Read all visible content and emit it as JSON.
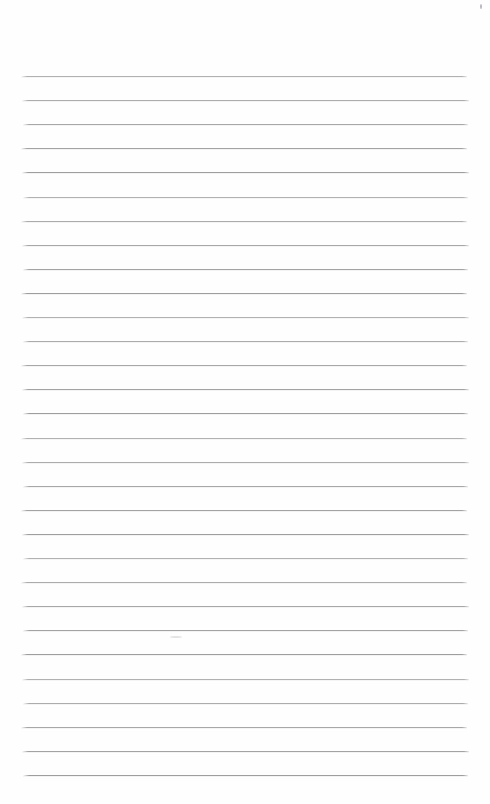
{
  "page": {
    "type": "blank-ruled-notebook-page",
    "background_color": "#fefefe",
    "width": 490,
    "height": 804,
    "text_content": ""
  },
  "ruling": {
    "line_count": 30,
    "first_line_y": 76,
    "line_spacing": 24.1,
    "left_x": 21,
    "right_x": 468,
    "line_color": "#949494",
    "line_thickness": 1
  },
  "artifacts": [
    {
      "name": "scan-speck-top-right",
      "x": 480,
      "y": 4,
      "width": 2,
      "height": 5,
      "color": "#b8b8c0"
    },
    {
      "name": "scan-smudge-mid-page",
      "x": 170,
      "y": 636,
      "width": 12,
      "height": 2,
      "color": "#e4e4e4"
    }
  ]
}
